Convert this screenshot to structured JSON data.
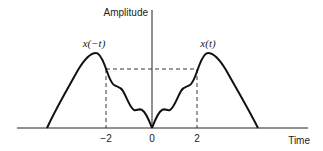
{
  "diagram": {
    "y_axis_label": "Amplitude",
    "x_axis_label": "Time",
    "curves": [
      {
        "label": "x(−t)",
        "side": "left"
      },
      {
        "label": "x(t)",
        "side": "right"
      }
    ],
    "ticks": [
      {
        "label": "−2",
        "value": -2
      },
      {
        "label": "0",
        "value": 0
      },
      {
        "label": "2",
        "value": 2
      }
    ],
    "annotations": {
      "dashed_level": "equal amplitude at t = −2 and t = 2"
    }
  }
}
